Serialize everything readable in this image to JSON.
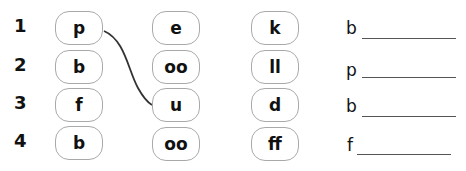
{
  "rows": [
    {
      "number": "1",
      "col1": "p",
      "col2": "e",
      "col3": "k",
      "answer_prefix": "b"
    },
    {
      "number": "2",
      "col1": "b",
      "col2": "oo",
      "col3": "ll",
      "answer_prefix": "p"
    },
    {
      "number": "3",
      "col1": "f",
      "col2": "u",
      "col3": "d",
      "answer_prefix": "b"
    },
    {
      "number": "4",
      "col1": "b",
      "col2": "oo",
      "col3": "ff",
      "answer_prefix": "f"
    }
  ],
  "connection": {
    "from": "row1-col1 (p)",
    "to": "row3-col2 (u)"
  },
  "colors": {
    "box_border": "#a9a9a9",
    "connector": "#333333",
    "text": "#111111"
  }
}
